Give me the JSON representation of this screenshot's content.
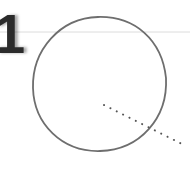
{
  "diagram": {
    "step_label": "1",
    "colors": {
      "background": "#ffffff",
      "circle_stroke": "#6e6e6e",
      "guide_line": "#dcdcdc",
      "dots": "#555555",
      "number": "#2b2b2b"
    },
    "circle": {
      "cx": 100,
      "cy": 84,
      "rx": 67,
      "ry": 68
    },
    "guide_line": {
      "y": 32
    },
    "dotted_line": {
      "x1": 104,
      "y1": 105,
      "x2": 186,
      "y2": 146
    }
  }
}
